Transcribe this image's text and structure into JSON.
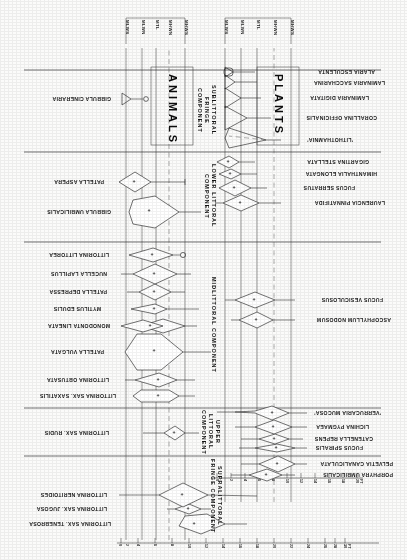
{
  "figure": {
    "type": "kite-diagram",
    "orientation": "printed upside down (rotated 180 degrees)",
    "categories": {
      "plants_label": "PLANTS",
      "animals_label": "ANIMALS"
    }
  },
  "zones": [
    {
      "id": "supralittoral-fringe",
      "label": "SUPRALITTORAL FRINGE COMPONENT"
    },
    {
      "id": "upper-littoral",
      "label": "UPPER LITTORAL COMPONENT"
    },
    {
      "id": "midlittoral",
      "label": "MIDLITTORAL COMPONENT"
    },
    {
      "id": "lower-littoral",
      "label": "LOWER LITTORAL COMPONENT"
    },
    {
      "id": "sublittoral-fringe",
      "label": "SUBLITTORAL FRINGE COMPONENT"
    }
  ],
  "tide_levels_plants": [
    "MHWS",
    "MHWN",
    "MTL",
    "MLWN",
    "MLWS"
  ],
  "tide_levels_animals": [
    "MHWS",
    "MHWN",
    "MTL",
    "MLWN",
    "MLWS"
  ],
  "plants": [
    {
      "name": "PORPHYRA UMBILICALIS",
      "zone": "supralittoral-fringe",
      "abundance": "+"
    },
    {
      "name": "PELVETIA CANALICULATA",
      "zone": "supralittoral-fringe",
      "abundance": "+"
    },
    {
      "name": "FUCUS SPIRALIS",
      "zone": "upper-littoral",
      "abundance": "+"
    },
    {
      "name": "CATENELLA REPENS",
      "zone": "upper-littoral",
      "abundance": "+"
    },
    {
      "name": "LICHINA PYGMAEA",
      "zone": "upper-littoral",
      "abundance": "+"
    },
    {
      "name": "'VERRUCARIA MUCOSA'",
      "zone": "upper-littoral",
      "abundance": "+"
    },
    {
      "name": "ASCOPHYLLUM NODOSUM",
      "zone": "midlittoral",
      "abundance": "+"
    },
    {
      "name": "FUCUS VESICULOSUS",
      "zone": "midlittoral",
      "abundance": "+"
    },
    {
      "name": "LAURENCIA PINNATIFIDA",
      "zone": "lower-littoral",
      "abundance": "+"
    },
    {
      "name": "FUCUS SERRATUS",
      "zone": "lower-littoral",
      "abundance": "+"
    },
    {
      "name": "HIMANTHALIA ELONGATA",
      "zone": "lower-littoral",
      "abundance": "+"
    },
    {
      "name": "GIGARTINA STELLATA",
      "zone": "lower-littoral",
      "abundance": "+"
    },
    {
      "name": "'LITHOTHAMNIA'",
      "zone": "sublittoral-fringe",
      "abundance": ""
    },
    {
      "name": "CORALLINA OFFICINALIS",
      "zone": "sublittoral-fringe",
      "abundance": ""
    },
    {
      "name": "LAMINARIA DIGITATA",
      "zone": "sublittoral-fringe",
      "abundance": ""
    },
    {
      "name": "LAMINARIA SACCHARINA",
      "zone": "sublittoral-fringe",
      "abundance": ""
    },
    {
      "name": "ALARIA ESCULENTA",
      "zone": "sublittoral-fringe",
      "abundance": ""
    }
  ],
  "animals": [
    {
      "name": "LITTORINA SAX. TENEBROSA",
      "zone": "supralittoral-fringe",
      "abundance": "+"
    },
    {
      "name": "LITTORINA SAX. JUGOSA",
      "zone": "supralittoral-fringe",
      "abundance": "+"
    },
    {
      "name": "LITTORINA NERITOIDES",
      "zone": "supralittoral-fringe",
      "abundance": "+"
    },
    {
      "name": "LITTORINA SAX. RUDIS",
      "zone": "upper-littoral",
      "abundance": "+"
    },
    {
      "name": "LITTORINA SAX. SAXATILIS",
      "zone": "midlittoral",
      "abundance": "+"
    },
    {
      "name": "LITTORINA OBTUSATA",
      "zone": "midlittoral",
      "abundance": "+"
    },
    {
      "name": "PATELLA VULGATA",
      "zone": "midlittoral",
      "abundance": "+"
    },
    {
      "name": "MONODONTA LINEATA",
      "zone": "midlittoral",
      "abundance": "+"
    },
    {
      "name": "MYTILUS EDULIS",
      "zone": "midlittoral",
      "abundance": "+"
    },
    {
      "name": "PATELLA DEPRESSA",
      "zone": "midlittoral",
      "abundance": "+"
    },
    {
      "name": "NUCELLA LAPILLUS",
      "zone": "midlittoral",
      "abundance": "+"
    },
    {
      "name": "LITTORINA LITTOREA",
      "zone": "midlittoral",
      "abundance": "+"
    },
    {
      "name": "GIBBULA UMBILICALIS",
      "zone": "lower-littoral",
      "abundance": "+"
    },
    {
      "name": "PATELLA ASPERA",
      "zone": "lower-littoral",
      "abundance": "+"
    },
    {
      "name": "GIBBULA CINERARIA",
      "zone": "sublittoral-fringe",
      "abundance": ""
    }
  ],
  "scales": [
    {
      "id": "scale-upper",
      "unit": "FT",
      "ticks": [
        "30",
        "28",
        "26",
        "24",
        "22",
        "20",
        "18",
        "16",
        "14",
        "12",
        "10",
        "8",
        "6",
        "4",
        "2",
        "0"
      ]
    },
    {
      "id": "scale-lower",
      "unit": "FT",
      "ticks": [
        "20",
        "18",
        "16",
        "14",
        "12",
        "10",
        "8",
        "6",
        "4",
        "2",
        "0"
      ]
    }
  ]
}
